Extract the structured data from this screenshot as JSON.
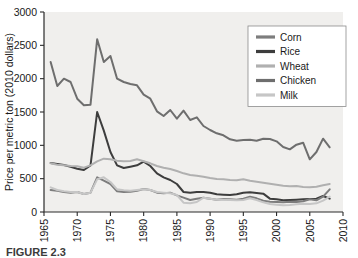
{
  "figure": {
    "caption": "FIGURE 2.3",
    "background_color": "#f0efed"
  },
  "chart_data": {
    "type": "line",
    "title": "",
    "xlabel": "",
    "ylabel": "Price per metric ton (2010 dollars)",
    "xlim": [
      1965,
      2010
    ],
    "ylim": [
      0,
      3000
    ],
    "xticks": [
      "1965",
      "1970",
      "1975",
      "1980",
      "1985",
      "1990",
      "1995",
      "2000",
      "2005",
      "2010"
    ],
    "xtick_values": [
      1965,
      1970,
      1975,
      1980,
      1985,
      1990,
      1995,
      2000,
      2005,
      2010
    ],
    "yticks": [
      "0",
      "500",
      "1000",
      "1500",
      "2000",
      "2500",
      "3000"
    ],
    "ytick_values": [
      0,
      500,
      1000,
      1500,
      2000,
      2500,
      3000
    ],
    "grid": false,
    "legend_position": "top-right",
    "x": [
      1966,
      1967,
      1968,
      1969,
      1970,
      1971,
      1972,
      1973,
      1974,
      1975,
      1976,
      1977,
      1978,
      1979,
      1980,
      1981,
      1982,
      1983,
      1984,
      1985,
      1986,
      1987,
      1988,
      1989,
      1990,
      1991,
      1992,
      1993,
      1994,
      1995,
      1996,
      1997,
      1998,
      1999,
      2000,
      2001,
      2002,
      2003,
      2004,
      2005,
      2006,
      2007,
      2008
    ],
    "series": [
      {
        "name": "Chicken",
        "color": "#6e6e6e",
        "values": [
          2250,
          1890,
          2000,
          1950,
          1700,
          1600,
          1610,
          2590,
          2250,
          2340,
          2000,
          1950,
          1920,
          1900,
          1760,
          1700,
          1510,
          1440,
          1530,
          1400,
          1520,
          1380,
          1420,
          1290,
          1230,
          1180,
          1150,
          1090,
          1070,
          1080,
          1085,
          1070,
          1100,
          1095,
          1060,
          975,
          940,
          1010,
          1040,
          790,
          900,
          1100,
          970
        ]
      },
      {
        "name": "Rice",
        "color": "#3d3d3d",
        "values": [
          735,
          720,
          705,
          680,
          650,
          630,
          700,
          1500,
          1220,
          900,
          700,
          660,
          680,
          700,
          755,
          690,
          580,
          520,
          480,
          420,
          300,
          290,
          300,
          300,
          290,
          265,
          260,
          255,
          265,
          290,
          295,
          285,
          275,
          200,
          190,
          175,
          180,
          185,
          190,
          195,
          200,
          240,
          200
        ]
      },
      {
        "name": "Wheat",
        "color": "#b0b0b0",
        "values": [
          730,
          710,
          700,
          690,
          685,
          665,
          700,
          760,
          800,
          790,
          770,
          760,
          765,
          790,
          760,
          730,
          690,
          665,
          645,
          615,
          580,
          555,
          545,
          530,
          510,
          495,
          490,
          480,
          475,
          490,
          470,
          455,
          440,
          425,
          410,
          395,
          385,
          390,
          375,
          370,
          380,
          400,
          420
        ]
      },
      {
        "name": "Corn",
        "color": "#7d7d7d",
        "values": [
          330,
          320,
          300,
          290,
          300,
          270,
          290,
          520,
          470,
          420,
          310,
          300,
          305,
          320,
          345,
          330,
          290,
          280,
          290,
          250,
          215,
          180,
          200,
          215,
          200,
          185,
          195,
          190,
          185,
          200,
          230,
          205,
          170,
          155,
          150,
          145,
          155,
          150,
          160,
          190,
          175,
          230,
          340
        ]
      },
      {
        "name": "Milk",
        "color": "#c6c6c6",
        "values": [
          370,
          330,
          310,
          300,
          300,
          270,
          290,
          490,
          520,
          450,
          340,
          325,
          320,
          330,
          340,
          330,
          300,
          290,
          280,
          255,
          140,
          130,
          150,
          215,
          200,
          185,
          185,
          180,
          175,
          180,
          205,
          180,
          145,
          120,
          110,
          100,
          105,
          115,
          125,
          120,
          130,
          170,
          230
        ]
      }
    ],
    "legend_entries": [
      {
        "label": "Corn",
        "color": "#7d7d7d"
      },
      {
        "label": "Rice",
        "color": "#3d3d3d"
      },
      {
        "label": "Wheat",
        "color": "#b0b0b0"
      },
      {
        "label": "Chicken",
        "color": "#6e6e6e"
      },
      {
        "label": "Milk",
        "color": "#c6c6c6"
      }
    ]
  }
}
